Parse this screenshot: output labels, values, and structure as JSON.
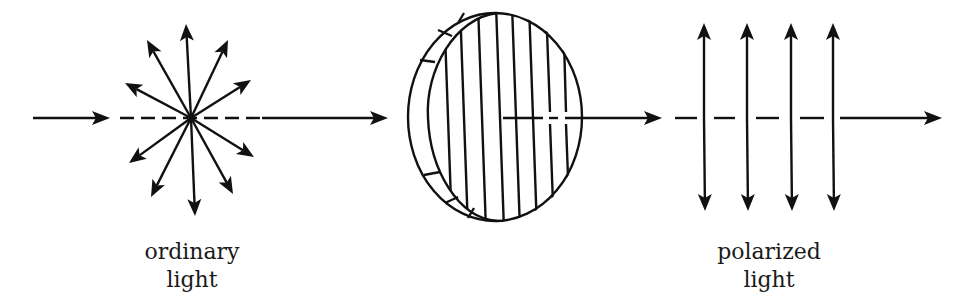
{
  "diagram": {
    "colors": {
      "ink": "#111111",
      "background": "#ffffff"
    },
    "labels": {
      "ordinary": {
        "line1": "ordinary",
        "line2": "light"
      },
      "polarized": {
        "line1": "polarized",
        "line2": "light"
      }
    },
    "beam_y": 118,
    "ordinary_light": {
      "center": [
        191,
        118
      ],
      "ray_count": 12,
      "ray_angles_deg": [
        -92,
        -62,
        -30,
        152,
        120,
        28,
        88,
        118,
        150,
        -152,
        -118,
        60
      ],
      "ray_length": 92
    },
    "polarizer": {
      "center": [
        495,
        117
      ],
      "outer_rx": 87,
      "outer_ry": 104,
      "grid_lines": 9
    },
    "polarized_light": {
      "arrow_x": [
        704,
        747,
        791,
        833
      ],
      "top_y": 23,
      "bottom_y": 211
    },
    "segments": {
      "incoming_arrow": [
        33,
        108
      ],
      "dash_start_1": 120,
      "solid_to_filter": [
        262,
        386
      ],
      "after_filter_arrow": [
        503,
        661
      ],
      "dash_start_2": 675,
      "final_arrow": [
        840,
        942
      ]
    }
  }
}
